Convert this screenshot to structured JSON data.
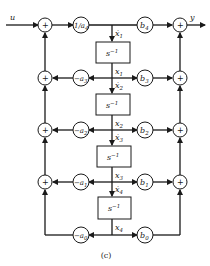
{
  "diagram": {
    "input_label": "u",
    "output_label": "y",
    "caption": "(c)",
    "sum_symbol": "+",
    "top_gain": "1/a4",
    "integrator_label": "s^-1",
    "feedback_gains": [
      "-a3",
      "-a2",
      "-a1",
      "-a0"
    ],
    "feedforward_gains": [
      "b4",
      "b3",
      "b2",
      "b1",
      "b0"
    ],
    "state_labels": [
      "x1",
      "x2",
      "x3",
      "x4"
    ],
    "derivative_labels": [
      "ẋ1",
      "ẋ2",
      "ẋ3",
      "ẋ4"
    ],
    "colors": {
      "stroke": "#1a1a1a",
      "background": "#ffffff"
    }
  }
}
